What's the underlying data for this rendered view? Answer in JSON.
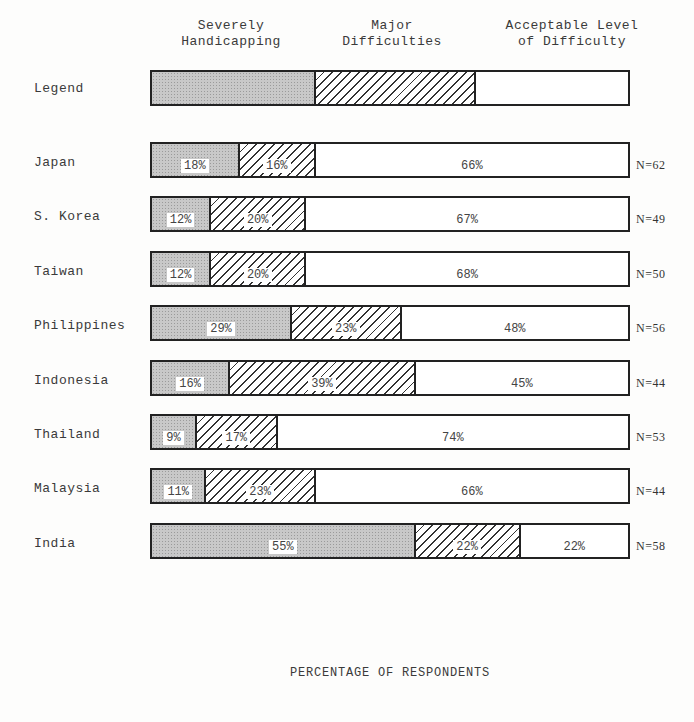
{
  "legend": {
    "row_label": "Legend",
    "categories": [
      {
        "line1": "Severely",
        "line2": "Handicapping"
      },
      {
        "line1": "Major",
        "line2": "Difficulties"
      },
      {
        "line1": "Acceptable Level",
        "line2": "of Difficulty"
      }
    ]
  },
  "x_axis_label": "PERCENTAGE OF RESPONDENTS",
  "rows": [
    {
      "country": "Japan",
      "sev": "18%",
      "maj": "16%",
      "acc": "66%",
      "n": "N=62"
    },
    {
      "country": "S. Korea",
      "sev": "12%",
      "maj": "20%",
      "acc": "67%",
      "n": "N=49"
    },
    {
      "country": "Taiwan",
      "sev": "12%",
      "maj": "20%",
      "acc": "68%",
      "n": "N=50"
    },
    {
      "country": "Philippines",
      "sev": "29%",
      "maj": "23%",
      "acc": "48%",
      "n": "N=56"
    },
    {
      "country": "Indonesia",
      "sev": "16%",
      "maj": "39%",
      "acc": "45%",
      "n": "N=44"
    },
    {
      "country": "Thailand",
      "sev": "9%",
      "maj": "17%",
      "acc": "74%",
      "n": "N=53"
    },
    {
      "country": "Malaysia",
      "sev": "11%",
      "maj": "23%",
      "acc": "66%",
      "n": "N=44"
    },
    {
      "country": "India",
      "sev": "55%",
      "maj": "22%",
      "acc": "22%",
      "n": "N=58"
    }
  ],
  "chart_data": {
    "type": "bar",
    "orientation": "horizontal",
    "stacked": true,
    "title": "",
    "xlabel": "PERCENTAGE OF RESPONDENTS",
    "ylabel": "",
    "xlim": [
      0,
      100
    ],
    "grid": false,
    "legend_position": "top",
    "categories": [
      "Japan",
      "S. Korea",
      "Taiwan",
      "Philippines",
      "Indonesia",
      "Thailand",
      "Malaysia",
      "India"
    ],
    "series": [
      {
        "name": "Severely Handicapping",
        "values": [
          18,
          12,
          12,
          29,
          16,
          9,
          11,
          55
        ]
      },
      {
        "name": "Major Difficulties",
        "values": [
          16,
          20,
          20,
          23,
          39,
          17,
          23,
          22
        ]
      },
      {
        "name": "Acceptable Level of Difficulty",
        "values": [
          66,
          67,
          68,
          48,
          45,
          74,
          66,
          22
        ]
      }
    ],
    "sample_sizes": [
      62,
      49,
      50,
      56,
      44,
      53,
      44,
      58
    ],
    "annotations": [
      "N=62",
      "N=49",
      "N=50",
      "N=56",
      "N=44",
      "N=53",
      "N=44",
      "N=58"
    ]
  }
}
